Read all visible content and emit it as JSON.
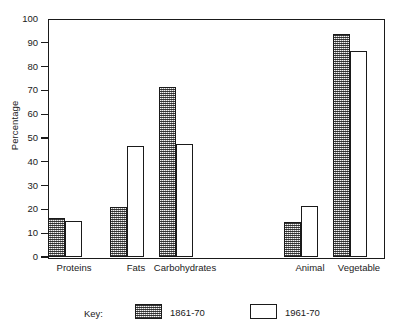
{
  "chart_data": {
    "type": "bar",
    "title": "",
    "xlabel": "",
    "ylabel": "Percentage",
    "ylim": [
      0,
      100
    ],
    "ytick_step": 10,
    "yticks": [
      0,
      10,
      20,
      30,
      40,
      50,
      60,
      70,
      80,
      90,
      100
    ],
    "ytick_labels": [
      "0",
      "10",
      "20",
      "30",
      "40",
      "50",
      "60",
      "70",
      "80",
      "90",
      "100"
    ],
    "grid": false,
    "legend_position": "below-plot",
    "legend_title": "Key:",
    "categories": [
      "Proteins",
      "Fats",
      "Carbohydrates",
      "Animal",
      "Vegetable"
    ],
    "series": [
      {
        "name": "1861-70",
        "style": "shaded",
        "color": "#9a9a9a",
        "values": [
          16.5,
          21,
          71.5,
          14.5,
          93.5
        ]
      },
      {
        "name": "1961-70",
        "style": "open",
        "color": "#ffffff",
        "values": [
          15,
          46.5,
          47.5,
          21.5,
          86.5
        ]
      }
    ],
    "group_positions": [
      {
        "category": "Proteins",
        "shaded_x": 48,
        "open_x": 65,
        "label_x": 74
      },
      {
        "category": "Fats",
        "shaded_x": 110,
        "open_x": 127,
        "label_x": 136
      },
      {
        "category": "Carbohydrates",
        "shaded_x": 159,
        "open_x": 176,
        "label_x": 185
      },
      {
        "category": "Animal",
        "shaded_x": 284,
        "open_x": 301,
        "label_x": 310
      },
      {
        "category": "Vegetable",
        "shaded_x": 333,
        "open_x": 350,
        "label_x": 359
      }
    ],
    "bar_width": 17,
    "axis_color": "#1a1a1a"
  },
  "legend": {
    "title": "Key:",
    "entries": [
      {
        "label": "1861-70",
        "style": "shaded",
        "swatch_x": 135,
        "label_x": 170
      },
      {
        "label": "1961-70",
        "style": "open",
        "swatch_x": 250,
        "label_x": 285
      }
    ]
  },
  "axis": {
    "y_title": "Percentage"
  }
}
